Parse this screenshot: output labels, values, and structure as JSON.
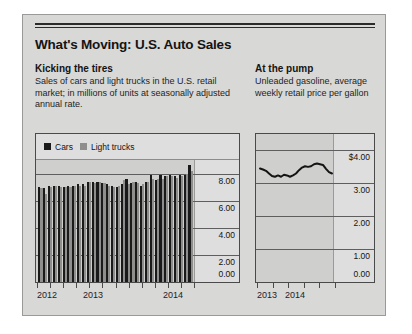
{
  "graphic": {
    "headline": "What's Moving: U.S. Auto Sales"
  },
  "left_section": {
    "subhead": "Kicking the tires",
    "description": "Sales of cars and light trucks in the U.S. retail market; in millions of units at seasonally adjusted annual rate."
  },
  "right_section": {
    "subhead": "At the pump",
    "description": "Unleaded gasoline, average weekly retail price per gallon"
  },
  "colors": {
    "cars": "#1a1a1a",
    "light_trucks": "#8e8e8c",
    "line": "#141414",
    "panel_bg": "#d8d8d6",
    "plot_bg": "#cfcfcd",
    "band_bg": "#dedede"
  },
  "chart_data": [
    {
      "type": "bar",
      "title": "Kicking the tires",
      "xlabel": "",
      "ylabel": "Millions of units (SAAR)",
      "ylim": [
        0,
        9
      ],
      "yticks": [
        "0.00",
        "2.00",
        "4.00",
        "6.00",
        "8.00"
      ],
      "ytick_values": [
        0,
        2,
        4,
        6,
        8
      ],
      "grid": true,
      "legend_position": "top-left",
      "legend": [
        "Cars",
        "Light trucks"
      ],
      "xtick_labels": [
        "2012",
        "2013",
        "2014"
      ],
      "categories": [
        "2012-Q1",
        "2012-Q2",
        "2012-Q3",
        "2012-Q4",
        "2012-M5",
        "2012-M6",
        "2012-M7",
        "2012-M8",
        "2013-M1",
        "2013-M2",
        "2013-M3",
        "2013-M4",
        "2013-M5",
        "2013-M6",
        "2013-M7",
        "2013-M8",
        "2013-M9",
        "2013-M10",
        "2013-M11",
        "2013-M12",
        "2014-M1",
        "2014-M2",
        "2014-M3",
        "2014-M4",
        "2014-M5",
        "2014-M6",
        "2014-M7",
        "2014-M8",
        "2014-M9",
        "2014-M10",
        "2014-M11",
        "2014-M12"
      ],
      "series": [
        {
          "name": "Cars",
          "values": [
            7.0,
            6.9,
            7.1,
            7.1,
            7.1,
            7.0,
            7.1,
            7.1,
            7.2,
            7.2,
            7.4,
            7.4,
            7.4,
            7.3,
            7.2,
            7.1,
            7.0,
            7.2,
            7.6,
            7.3,
            7.4,
            7.1,
            7.4,
            7.9,
            7.5,
            7.9,
            7.8,
            7.9,
            7.8,
            7.9,
            7.9,
            8.6
          ]
        },
        {
          "name": "Light trucks",
          "values": [
            6.9,
            6.5,
            7.0,
            7.1,
            7.0,
            7.0,
            7.0,
            7.1,
            7.1,
            7.1,
            7.4,
            7.3,
            7.4,
            7.3,
            7.1,
            7.0,
            7.1,
            7.5,
            7.2,
            7.4,
            7.3,
            7.2,
            7.4,
            7.6,
            7.6,
            7.6,
            7.8,
            7.8,
            7.7,
            7.8,
            8.0,
            8.2
          ]
        }
      ]
    },
    {
      "type": "line",
      "title": "At the pump",
      "xlabel": "",
      "ylabel": "Price per gallon",
      "ylim": [
        0,
        4.5
      ],
      "yticks": [
        "$4.00",
        "3.00",
        "2.00",
        "1.00",
        "0.00"
      ],
      "ytick_values": [
        4,
        3,
        2,
        1,
        0
      ],
      "grid": true,
      "xtick_labels": [
        "2013",
        "2014"
      ],
      "series": [
        {
          "name": "Unleaded gasoline",
          "values": [
            3.45,
            3.42,
            3.38,
            3.3,
            3.22,
            3.2,
            3.24,
            3.2,
            3.26,
            3.24,
            3.2,
            3.24,
            3.3,
            3.4,
            3.48,
            3.52,
            3.5,
            3.52,
            3.58,
            3.6,
            3.58,
            3.56,
            3.44,
            3.34,
            3.3
          ]
        }
      ]
    }
  ]
}
